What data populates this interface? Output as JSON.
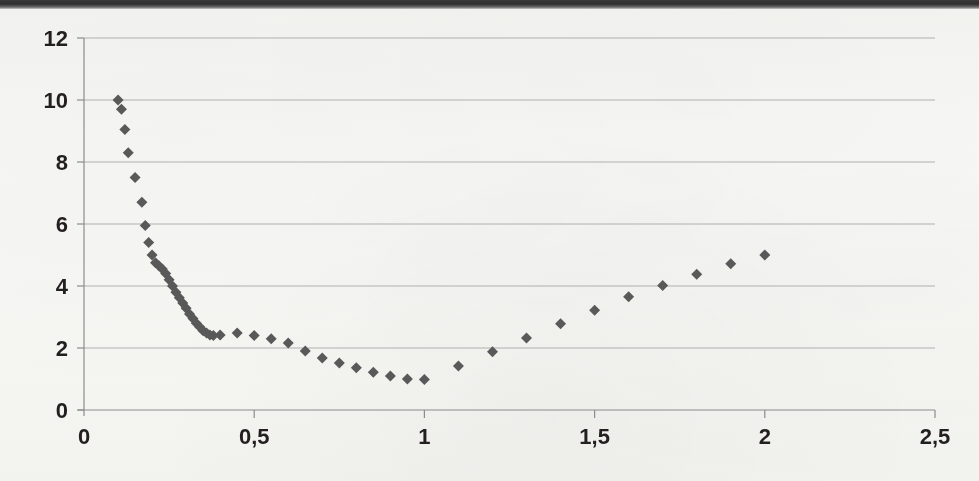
{
  "chart_data": {
    "type": "scatter",
    "title": "",
    "subtitle": "",
    "xlabel": "",
    "ylabel": "",
    "xlim": [
      0,
      2.5
    ],
    "ylim": [
      0,
      12
    ],
    "grid": true,
    "legend": null,
    "legend_position": "none",
    "marker": "diamond",
    "marker_color": "#595959",
    "marker_size_px": 11,
    "gridline_color": "#b0b0b0",
    "axis_color": "#8c8c8c",
    "x_ticks": [
      0,
      0.5,
      1,
      1.5,
      2,
      2.5
    ],
    "x_tick_labels": [
      "0",
      "0,5",
      "1",
      "1,5",
      "2",
      "2,5"
    ],
    "y_ticks": [
      0,
      2,
      4,
      6,
      8,
      10,
      12
    ],
    "y_tick_labels": [
      "0",
      "2",
      "4",
      "6",
      "8",
      "10",
      "12"
    ],
    "decimal_separator": ",",
    "x": [
      0.1,
      0.11,
      0.12,
      0.13,
      0.15,
      0.17,
      0.18,
      0.19,
      0.2,
      0.21,
      0.22,
      0.23,
      0.24,
      0.25,
      0.26,
      0.27,
      0.28,
      0.29,
      0.3,
      0.31,
      0.32,
      0.33,
      0.34,
      0.35,
      0.36,
      0.37,
      0.38,
      0.4,
      0.45,
      0.5,
      0.55,
      0.6,
      0.65,
      0.7,
      0.75,
      0.8,
      0.85,
      0.9,
      0.95,
      1.0,
      1.1,
      1.2,
      1.3,
      1.4,
      1.5,
      1.6,
      1.7,
      1.8,
      1.9,
      2.0
    ],
    "y": [
      10.0,
      9.7,
      9.05,
      8.3,
      7.5,
      6.7,
      5.95,
      5.4,
      5.0,
      4.75,
      4.65,
      4.55,
      4.4,
      4.2,
      4.0,
      3.8,
      3.62,
      3.45,
      3.28,
      3.1,
      2.95,
      2.8,
      2.68,
      2.56,
      2.48,
      2.42,
      2.4,
      2.42,
      2.48,
      2.4,
      2.3,
      2.16,
      1.9,
      1.68,
      1.52,
      1.36,
      1.22,
      1.1,
      1.0,
      0.98,
      1.42,
      1.88,
      2.32,
      2.78,
      3.22,
      3.65,
      4.02,
      4.38,
      4.72,
      5.0
    ]
  },
  "plot_geometry": {
    "left_px": 84,
    "right_px": 935,
    "top_px": 38,
    "bottom_px": 410
  }
}
